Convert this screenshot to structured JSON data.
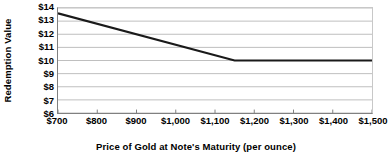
{
  "chart_data": {
    "type": "line",
    "title": "",
    "xlabel": "Price of Gold at Note's Maturity (per ounce)",
    "ylabel": "Redemption Value",
    "xlim": [
      700,
      1500
    ],
    "ylim": [
      6,
      14
    ],
    "grid": true,
    "legend": false,
    "x_tick_labels": [
      "$700",
      "$800",
      "$900",
      "$1,000",
      "$1,100",
      "$1,200",
      "$1,300",
      "$1,400",
      "$1,500"
    ],
    "x_tick_values": [
      700,
      800,
      900,
      1000,
      1100,
      1200,
      1300,
      1400,
      1500
    ],
    "y_tick_labels": [
      "$14",
      "$13",
      "$12",
      "$11",
      "$10",
      "$9",
      "$8",
      "$7",
      "$6"
    ],
    "y_tick_values": [
      14,
      13,
      12,
      11,
      10,
      9,
      8,
      7,
      6
    ],
    "series": [
      {
        "name": "Redemption Value",
        "color": "#1a1a1a",
        "line_width": 2.2,
        "x": [
          700,
          1150,
          1500
        ],
        "values": [
          13.6,
          10.0,
          10.0
        ]
      }
    ],
    "annotations": [],
    "axis_color": "#808080",
    "grid_color": "#bfbfbf"
  },
  "axes": {
    "y_title": "Redemption Value",
    "x_title": "Price of Gold at Note's Maturity (per ounce)"
  }
}
